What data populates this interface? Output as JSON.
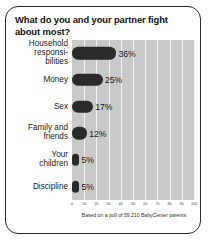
{
  "card": {
    "title": "What do you and your partner fight about most?",
    "caption": "Based on a poll of 59,210 BabyCenter parents"
  },
  "chart_data": {
    "type": "bar",
    "orientation": "horizontal",
    "title": "What do you and your partner fight about most?",
    "xlabel": "",
    "ylabel": "",
    "xlim": [
      0,
      100
    ],
    "grid": true,
    "legend": false,
    "annotation": "Based on a poll of 59,210 BabyCenter parents",
    "categories": [
      "Household responsi-bilities",
      "Money",
      "Sex",
      "Family and friends",
      "Your children",
      "Discipline"
    ],
    "values": [
      36,
      25,
      17,
      12,
      5,
      5
    ],
    "value_labels": [
      "36%",
      "25%",
      "17%",
      "12%",
      "5%",
      "5%"
    ],
    "xticks": [
      0,
      10,
      20,
      30,
      40,
      50,
      60,
      70,
      80,
      90,
      100
    ],
    "xtick_labels": [
      "0",
      "10",
      "20",
      "30",
      "40",
      "50",
      "60",
      "70",
      "80",
      "90",
      "100"
    ],
    "colors": {
      "bar": "#2a2a2a",
      "plot_background": "#c9c9c9",
      "gridline": "#f2f2f2",
      "card_background": "#ffffff",
      "border": "#2b2b2b",
      "text": "#111111"
    }
  }
}
